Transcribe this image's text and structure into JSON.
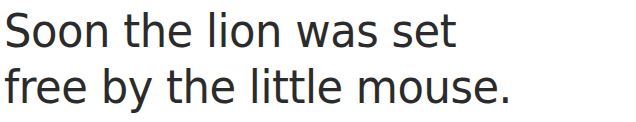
{
  "document": {
    "type": "handwriting-practice-sentence",
    "background_color": "#ffffff",
    "text_color": "#2b2b2b",
    "full_text": "Soon the lion was set free by the little mouse.",
    "lines": [
      {
        "text": "Soon the lion was set"
      },
      {
        "text": "free by the little mouse."
      }
    ]
  }
}
